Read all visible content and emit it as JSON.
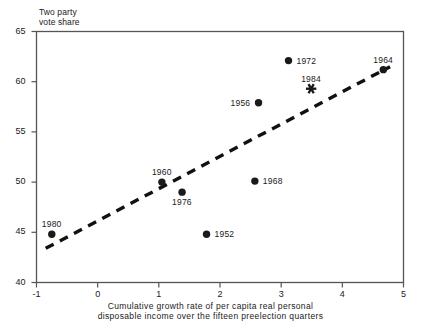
{
  "chart_data": {
    "type": "scatter",
    "title": "",
    "ylabel_lines": [
      "Two party",
      "vote share"
    ],
    "xlabel_lines": [
      "Cumulative growth rate of per capita real personal",
      "disposable income over the fifteen preelection quarters"
    ],
    "xlabel": "Cumulative growth rate of per capita real personal disposable income over the fifteen preelection quarters",
    "ylabel": "Two party vote share",
    "xlim": [
      -1,
      5
    ],
    "ylim": [
      40,
      65
    ],
    "xticks": [
      -1,
      0,
      1,
      2,
      3,
      4,
      5
    ],
    "xtick_labels": [
      "-1",
      "0",
      "1",
      "2",
      "3",
      "4",
      "5"
    ],
    "yticks": [
      40,
      45,
      50,
      55,
      60,
      65
    ],
    "ytick_labels": [
      "40",
      "45",
      "50",
      "55",
      "60",
      "65"
    ],
    "grid": false,
    "legend": "none",
    "points": [
      {
        "label": "1980",
        "x": -0.75,
        "y": 44.8,
        "marker": "circle",
        "label_pos": "above"
      },
      {
        "label": "1960",
        "x": 1.05,
        "y": 50.0,
        "marker": "circle",
        "label_pos": "above"
      },
      {
        "label": "1976",
        "x": 1.38,
        "y": 49.0,
        "marker": "circle",
        "label_pos": "below"
      },
      {
        "label": "1952",
        "x": 1.78,
        "y": 44.8,
        "marker": "circle",
        "label_pos": "right"
      },
      {
        "label": "1968",
        "x": 2.57,
        "y": 50.1,
        "marker": "circle",
        "label_pos": "right"
      },
      {
        "label": "1956",
        "x": 2.63,
        "y": 57.9,
        "marker": "circle",
        "label_pos": "left"
      },
      {
        "label": "1972",
        "x": 3.12,
        "y": 62.1,
        "marker": "circle",
        "label_pos": "right"
      },
      {
        "label": "1984",
        "x": 3.49,
        "y": 59.3,
        "marker": "asterisk",
        "label_pos": "above"
      },
      {
        "label": "1964",
        "x": 4.67,
        "y": 61.2,
        "marker": "circle",
        "label_pos": "above"
      }
    ],
    "trendline": {
      "style": "dashed",
      "x_start": -0.85,
      "y_start": 43.4,
      "x_end": 4.78,
      "y_end": 61.5
    },
    "colors": {
      "marker": "#1a1a1a",
      "axis": "#555555",
      "trendline": "#111111",
      "background": "#ffffff"
    }
  }
}
